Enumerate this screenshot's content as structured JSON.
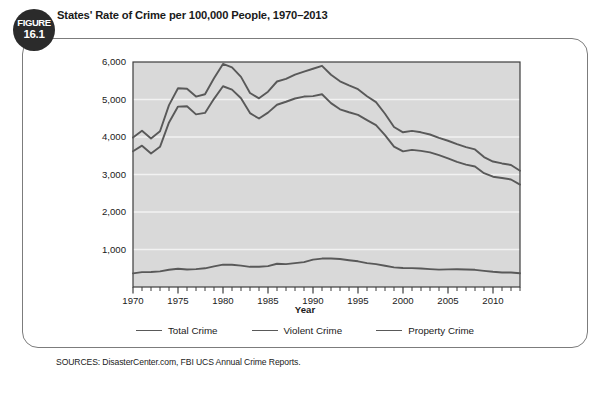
{
  "figure": {
    "badge_word": "FIGURE",
    "badge_number": "16.1",
    "title": "States' Rate of Crime per 100,000 People, 1970–2013",
    "sources": "SOURCES: DisasterCenter.com, FBI UCS Annual Crime Reports."
  },
  "legend": {
    "items": [
      {
        "label": "Total Crime",
        "color": "#595959"
      },
      {
        "label": "Violent Crime",
        "color": "#595959"
      },
      {
        "label": "Property Crime",
        "color": "#595959"
      }
    ]
  },
  "colors": {
    "plot_background": "#d9d9d9",
    "gridline": "#f2f2f2",
    "axis": "#3d3d3d",
    "line": "#595959",
    "badge_background": "#2b2b2b",
    "frame_border": "#7c7c7c"
  },
  "chart_data": {
    "type": "line",
    "title": "States' Rate of Crime per 100,000 People, 1970–2013",
    "xlabel": "Year",
    "ylabel": "",
    "xlim": [
      1970,
      2013
    ],
    "ylim": [
      0,
      6000
    ],
    "yticks": [
      1000,
      2000,
      3000,
      4000,
      5000,
      6000
    ],
    "ytick_labels": [
      "1,000",
      "2,000",
      "3,000",
      "4,000",
      "5,000",
      "6,000"
    ],
    "xticks": [
      1970,
      1975,
      1980,
      1985,
      1990,
      1995,
      2000,
      2005,
      2010
    ],
    "xtick_labels": [
      "1970",
      "1975",
      "1980",
      "1985",
      "1990",
      "1995",
      "2000",
      "2005",
      "2010"
    ],
    "minor_xtick_interval": 1,
    "grid": true,
    "legend_position": "bottom",
    "x": [
      1970,
      1971,
      1972,
      1973,
      1974,
      1975,
      1976,
      1977,
      1978,
      1979,
      1980,
      1981,
      1982,
      1983,
      1984,
      1985,
      1986,
      1987,
      1988,
      1989,
      1990,
      1991,
      1992,
      1993,
      1994,
      1995,
      1996,
      1997,
      1998,
      1999,
      2000,
      2001,
      2002,
      2003,
      2004,
      2005,
      2006,
      2007,
      2008,
      2009,
      2010,
      2011,
      2012,
      2013
    ],
    "series": [
      {
        "name": "Total Crime",
        "values": [
          3985,
          4165,
          3961,
          4154,
          4850,
          5298,
          5287,
          5078,
          5140,
          5566,
          5950,
          5858,
          5604,
          5175,
          5031,
          5207,
          5480,
          5550,
          5664,
          5741,
          5820,
          5898,
          5660,
          5484,
          5374,
          5275,
          5087,
          4930,
          4620,
          4267,
          4125,
          4163,
          4125,
          4067,
          3977,
          3900,
          3809,
          3730,
          3669,
          3466,
          3346,
          3295,
          3255,
          3099
        ]
      },
      {
        "name": "Violent Crime",
        "values": [
          364,
          396,
          401,
          417,
          461,
          487,
          468,
          476,
          498,
          549,
          597,
          594,
          571,
          538,
          539,
          557,
          620,
          610,
          637,
          663,
          730,
          758,
          758,
          747,
          714,
          685,
          637,
          611,
          568,
          523,
          506,
          504,
          494,
          476,
          463,
          469,
          474,
          467,
          458,
          431,
          405,
          387,
          387,
          368
        ]
      },
      {
        "name": "Property Crime",
        "values": [
          3621,
          3769,
          3560,
          3737,
          4389,
          4811,
          4819,
          4602,
          4642,
          5017,
          5353,
          5264,
          5033,
          4637,
          4492,
          4650,
          4860,
          4940,
          5027,
          5078,
          5090,
          5140,
          4903,
          4738,
          4660,
          4591,
          4451,
          4316,
          4052,
          3744,
          3618,
          3658,
          3631,
          3591,
          3514,
          3432,
          3335,
          3264,
          3212,
          3036,
          2941,
          2908,
          2868,
          2731
        ]
      }
    ]
  }
}
